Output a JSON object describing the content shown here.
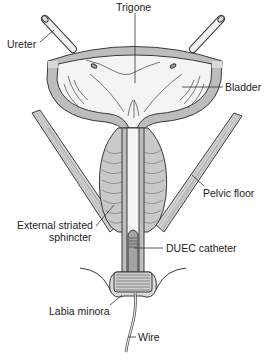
{
  "diagram": {
    "type": "anatomical-illustration",
    "labels": {
      "trigone": "Trigone",
      "ureter": "Ureter",
      "bladder": "Bladder",
      "pelvic_floor": "Pelvic floor",
      "external_sphincter_line1": "External striated",
      "external_sphincter_line2": "sphincter",
      "duec_catheter": "DUEC catheter",
      "labia_minora": "Labia minora",
      "wire": "Wire"
    },
    "colors": {
      "wall_gray": "#b9b9b9",
      "light_fill": "#ececec",
      "lumen_fill": "#f7f7f7",
      "line": "#3a3a3a",
      "catheter_fill": "#9a9a9a"
    }
  }
}
